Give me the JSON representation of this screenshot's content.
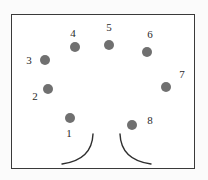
{
  "figure": {
    "frame": {
      "x": 11,
      "y": 14,
      "width": 182,
      "height": 153,
      "stroke": "#3a3a3a"
    },
    "dot_color": "#707070",
    "dot_radius": 5,
    "arc_color": "#2f2f2f",
    "points": [
      {
        "label": "1",
        "x": 70,
        "y": 118,
        "label_x": 69,
        "label_y": 133
      },
      {
        "label": "2",
        "x": 48,
        "y": 89,
        "label_x": 35,
        "label_y": 96
      },
      {
        "label": "3",
        "x": 45,
        "y": 60,
        "label_x": 29,
        "label_y": 60
      },
      {
        "label": "4",
        "x": 75,
        "y": 47,
        "label_x": 73,
        "label_y": 33
      },
      {
        "label": "5",
        "x": 109,
        "y": 45,
        "label_x": 109,
        "label_y": 27
      },
      {
        "label": "6",
        "x": 147,
        "y": 52,
        "label_x": 150,
        "label_y": 34
      },
      {
        "label": "7",
        "x": 166,
        "y": 87,
        "label_x": 182,
        "label_y": 74
      },
      {
        "label": "8",
        "x": 132,
        "y": 125,
        "label_x": 150,
        "label_y": 120
      }
    ],
    "arcs": [
      {
        "name": "left-arc",
        "path": "M 93 134 Q 92 160 62 164"
      },
      {
        "name": "right-arc",
        "path": "M 120 134 Q 121 160 151 164"
      }
    ]
  }
}
